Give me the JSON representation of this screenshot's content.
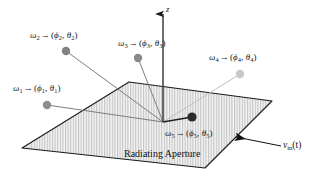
{
  "figure": {
    "background_color": "#ffffff",
    "width": 327,
    "height": 184
  },
  "axis": {
    "z_label": "z",
    "origin": {
      "x": 163,
      "y": 122
    },
    "tip": {
      "y": 14
    }
  },
  "aperture": {
    "label": "Radiating Aperture",
    "label_x": 124,
    "label_y": 148,
    "fill_color": "#f2f2f2",
    "hatch_color": "#b9b9b9",
    "edge_color": "#1a1a1a",
    "corners": {
      "top": {
        "x": 129,
        "y": 82
      },
      "right": {
        "x": 272,
        "y": 101
      },
      "bottom": {
        "x": 205,
        "y": 168
      },
      "left": {
        "x": 22,
        "y": 148
      }
    }
  },
  "input_signal": {
    "label_v": "v",
    "label_sub": "in",
    "label_paren": "(t)",
    "label_x": 283,
    "label_y": 146,
    "arrow_from": {
      "x": 281,
      "y": 146
    },
    "arrow_to": {
      "x": 233,
      "y": 137
    },
    "color": "#111111"
  },
  "sources": [
    {
      "id": "omega-1",
      "omega": "ω",
      "index": "1",
      "arrow": "→",
      "phi": "ϕ",
      "theta": "θ",
      "dot": {
        "x": 47,
        "y": 105,
        "r": 4.2,
        "color": "#8e8e8e"
      },
      "label": {
        "x": 13,
        "y": 84
      },
      "ray_color": "#7d7d7d",
      "ray_width": 1.0
    },
    {
      "id": "omega-2",
      "omega": "ω",
      "index": "2",
      "arrow": "→",
      "phi": "ϕ",
      "theta": "θ",
      "dot": {
        "x": 66,
        "y": 51,
        "r": 4.2,
        "color": "#828282"
      },
      "label": {
        "x": 30,
        "y": 31
      },
      "ray_color": "#7d7d7d",
      "ray_width": 1.0
    },
    {
      "id": "omega-3",
      "omega": "ω",
      "index": "3",
      "arrow": "→",
      "phi": "ϕ",
      "theta": "θ",
      "dot": {
        "x": 138,
        "y": 58,
        "r": 4.2,
        "color": "#8a8a8a"
      },
      "label": {
        "x": 118,
        "y": 39
      },
      "ray_color": "#7d7d7d",
      "ray_width": 1.0
    },
    {
      "id": "omega-4",
      "omega": "ω",
      "index": "4",
      "arrow": "→",
      "phi": "ϕ",
      "theta": "θ",
      "dot": {
        "x": 240,
        "y": 74,
        "r": 4.2,
        "color": "#c8c8c8"
      },
      "label": {
        "x": 209,
        "y": 53
      },
      "ray_color": "#c0c0c0",
      "ray_width": 1.0
    },
    {
      "id": "omega-5",
      "omega": "ω",
      "index": "5",
      "arrow": "→",
      "phi": "ϕ",
      "theta": "θ",
      "dot": {
        "x": 192,
        "y": 117,
        "r": 4.6,
        "color": "#2b2b2b"
      },
      "label": {
        "x": 165,
        "y": 129
      },
      "ray_color": "#1f1f1f",
      "ray_width": 1.3
    }
  ]
}
